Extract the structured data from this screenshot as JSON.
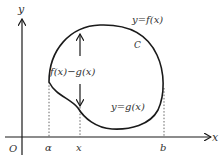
{
  "diagram": {
    "type": "area-between-curves",
    "axes": {
      "x_label": "x",
      "y_label": "y",
      "origin_label": "O"
    },
    "curves": {
      "closed_curve_label": "C",
      "upper_label": "y=f(x)",
      "lower_label": "y=g(x)"
    },
    "x_ticks": [
      {
        "label": "α"
      },
      {
        "label": "x"
      },
      {
        "label": "b"
      }
    ],
    "height_label": "f(x)−g(x)",
    "colors": {
      "stroke": "#1a1a1a",
      "text": "#333333",
      "background": "#ffffff"
    }
  }
}
